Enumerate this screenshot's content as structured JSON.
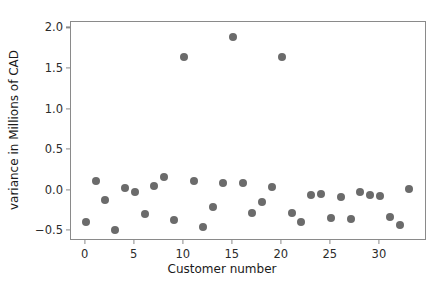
{
  "chart_data": {
    "type": "scatter",
    "title": "",
    "xlabel": "Customer number",
    "ylabel": "variance in Millions of CAD",
    "xlim": [
      -1.5,
      34.8
    ],
    "ylim": [
      -0.62,
      2.08
    ],
    "xticks": [
      0,
      5,
      10,
      15,
      20,
      25,
      30
    ],
    "xtick_labels": [
      "0",
      "5",
      "10",
      "15",
      "20",
      "25",
      "30"
    ],
    "yticks": [
      -0.5,
      0.0,
      0.5,
      1.0,
      1.5,
      2.0
    ],
    "ytick_labels": [
      "−0.5",
      "0.0",
      "0.5",
      "1.0",
      "1.5",
      "2.0"
    ],
    "grid": false,
    "legend": null,
    "marker_color": "#6b6b6b",
    "marker_size": 8,
    "x": [
      0,
      1,
      2,
      3,
      4,
      5,
      6,
      7,
      8,
      9,
      10,
      11,
      12,
      13,
      14,
      15,
      16,
      17,
      18,
      19,
      20,
      21,
      22,
      23,
      24,
      25,
      26,
      27,
      28,
      29,
      30,
      31,
      32,
      33
    ],
    "y": [
      -0.38,
      0.12,
      -0.12,
      -0.49,
      0.03,
      -0.02,
      -0.29,
      0.06,
      0.17,
      -0.36,
      1.65,
      0.12,
      -0.45,
      -0.2,
      0.09,
      1.89,
      0.09,
      -0.27,
      -0.14,
      0.04,
      1.65,
      -0.28,
      -0.38,
      -0.05,
      -0.04,
      -0.34,
      -0.08,
      -0.35,
      -0.01,
      -0.05,
      -0.07,
      -0.33,
      -0.42,
      0.02
    ]
  },
  "style": {
    "axis_color": "#8a8a8a",
    "text_color": "#1a1a1a",
    "background": "#ffffff"
  }
}
